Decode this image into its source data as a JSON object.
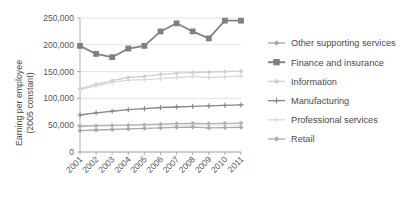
{
  "chart_data": {
    "type": "line",
    "title": "",
    "xlabel": "",
    "ylabel": "Earning per employee\n(2005 constant)",
    "ylabel_line1": "Earning per employee",
    "ylabel_line2": "(2005 constant)",
    "categories": [
      "2001",
      "2002",
      "2003",
      "2004",
      "2005",
      "2006",
      "2007",
      "2008",
      "2009",
      "2010",
      "2011"
    ],
    "x": [
      2001,
      2002,
      2003,
      2004,
      2005,
      2006,
      2007,
      2008,
      2009,
      2010,
      2011
    ],
    "ylim": [
      0,
      250000
    ],
    "yticks": [
      0,
      50000,
      100000,
      150000,
      200000,
      250000
    ],
    "ytick_labels": [
      "0",
      "50,000",
      "100,000",
      "150,000",
      "200,000",
      "250,000"
    ],
    "grid": true,
    "legend_position": "right",
    "xtick_rotation": -45,
    "series": [
      {
        "name": "Other supporting services",
        "color": "#a8a8a8",
        "marker": "diamond",
        "values": [
          40000,
          41000,
          42000,
          43000,
          44000,
          45000,
          46000,
          46500,
          45000,
          45500,
          46000
        ]
      },
      {
        "name": "Finance and insurance",
        "color": "#808080",
        "marker": "square",
        "values": [
          198000,
          183000,
          177000,
          193000,
          198000,
          225000,
          240000,
          225000,
          212000,
          245000,
          245000
        ]
      },
      {
        "name": "Information",
        "color": "#cfcfcf",
        "marker": "diamond",
        "values": [
          118000,
          126000,
          133000,
          139000,
          141000,
          145000,
          147000,
          148000,
          149000,
          150000,
          151000
        ]
      },
      {
        "name": "Manufacturing",
        "color": "#888888",
        "marker": "plus",
        "values": [
          69000,
          73000,
          76000,
          79000,
          81000,
          83000,
          84000,
          85000,
          86000,
          87000,
          88000
        ]
      },
      {
        "name": "Professional services",
        "color": "#d8d8d8",
        "marker": "plus",
        "values": [
          116000,
          124000,
          130000,
          134000,
          135000,
          137000,
          139000,
          141000,
          139000,
          140000,
          142000
        ]
      },
      {
        "name": "Retail",
        "color": "#b0b0b0",
        "marker": "diamond",
        "values": [
          48000,
          49000,
          49500,
          50000,
          51000,
          52000,
          53000,
          53500,
          53000,
          53500,
          54000
        ]
      }
    ]
  }
}
